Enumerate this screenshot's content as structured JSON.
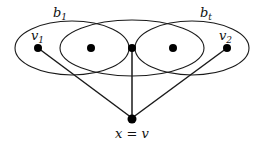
{
  "diagram": {
    "blocks": [
      {
        "id": "b1",
        "label": "b",
        "subscript": "1"
      },
      {
        "id": "mid",
        "label": "",
        "subscript": ""
      },
      {
        "id": "bt",
        "label": "b",
        "subscript": "t"
      }
    ],
    "nodes": [
      {
        "id": "v1",
        "label": "v",
        "subscript": "1"
      },
      {
        "id": "n2",
        "label": "",
        "subscript": ""
      },
      {
        "id": "n3",
        "label": "",
        "subscript": ""
      },
      {
        "id": "n4",
        "label": "",
        "subscript": ""
      },
      {
        "id": "v2",
        "label": "v",
        "subscript": "2"
      },
      {
        "id": "x",
        "label": "x = v",
        "subscript": ""
      }
    ],
    "edges": [
      {
        "from": "x",
        "to": "v1"
      },
      {
        "from": "x",
        "to": "n3"
      },
      {
        "from": "x",
        "to": "v2"
      }
    ],
    "colors": {
      "stroke": "#1a1a1a",
      "node": "#000000",
      "background": "#ffffff"
    }
  }
}
